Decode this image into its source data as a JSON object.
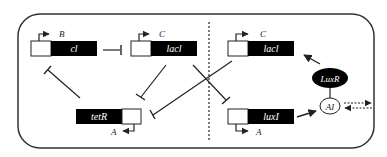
{
  "diagram": {
    "genes": [
      {
        "id": "cI",
        "name": "cl",
        "promoter": "B"
      },
      {
        "id": "lacI-left",
        "name": "lacl",
        "promoter": "C"
      },
      {
        "id": "tetR",
        "name": "tetR",
        "promoter": "A"
      },
      {
        "id": "lacI-right",
        "name": "lacl",
        "promoter": "C"
      },
      {
        "id": "luxI",
        "name": "luxI",
        "promoter": "A"
      }
    ],
    "molecules": {
      "luxr": "LuxR",
      "ai": "AI"
    },
    "colors": {
      "gene_fill": "#000000",
      "promoter_fill": "#ffffff",
      "line": "#222222",
      "text_on_gene": "#ffffff"
    }
  }
}
